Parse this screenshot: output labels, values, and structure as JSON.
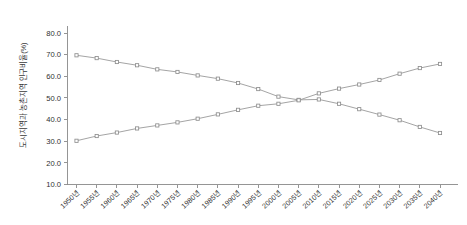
{
  "chart_data": {
    "type": "line",
    "title": "",
    "xlabel": "",
    "ylabel": "도시지역과 농촌지역 인구비율(%)",
    "ylim": [
      10.0,
      85.0
    ],
    "ytick_labels": [
      "10.0",
      "20.0",
      "30.0",
      "40.0",
      "50.0",
      "60.0",
      "70.0",
      "80.0"
    ],
    "ytick_values": [
      10.0,
      20.0,
      30.0,
      40.0,
      50.0,
      60.0,
      70.0,
      80.0
    ],
    "grid": false,
    "legend_position": "none",
    "marker": "open-square",
    "line_color": "#9a9a9a",
    "marker_fill": "#ffffff",
    "marker_stroke": "#8e8e8e",
    "categories": [
      "1950년",
      "1955년",
      "1960년",
      "1965년",
      "1970년",
      "1975년",
      "1980년",
      "1985년",
      "1990년",
      "1995년",
      "2000년",
      "2005년",
      "2010년",
      "2015년",
      "2020년",
      "2025년",
      "2030년",
      "2035년",
      "2040년"
    ],
    "series": [
      {
        "name": "농촌지역 인구비율",
        "values": [
          69.7,
          68.4,
          66.6,
          65.1,
          63.2,
          62.0,
          60.4,
          58.9,
          56.9,
          54.1,
          50.6,
          49.1,
          49.3,
          47.3,
          44.8,
          42.3,
          39.7,
          36.6,
          33.8
        ]
      },
      {
        "name": "도시지역 인구비율",
        "values": [
          30.2,
          32.4,
          34.0,
          35.9,
          37.3,
          38.7,
          40.4,
          42.4,
          44.5,
          46.4,
          47.3,
          48.9,
          52.1,
          54.3,
          56.2,
          58.3,
          61.2,
          63.8,
          65.7
        ]
      }
    ],
    "annotations": []
  }
}
